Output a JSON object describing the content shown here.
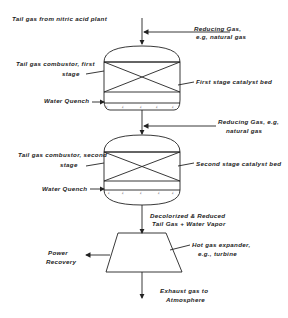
{
  "diagram": {
    "type": "process-flow",
    "labels": {
      "tail_gas_inlet": "Tail gas from nitric acid plant",
      "reducing_gas_1_line1": "Reducing Gas,",
      "reducing_gas_1_line2": "e.g, natural gas",
      "combustor_1_line1": "Tail gas combustor, first",
      "combustor_1_line2": "stage",
      "catalyst_bed_1": "First stage catalyst bed",
      "water_quench_1": "Water Quench",
      "reducing_gas_2_line1": "Reducing Gas, e.g,",
      "reducing_gas_2_line2": "natural gas",
      "combustor_2_line1": "Tail gas combustor, second",
      "combustor_2_line2": "stage",
      "catalyst_bed_2": "Second stage catalyst bed",
      "water_quench_2": "Water Quench",
      "outlet_1_line1": "Decolorized & Reduced",
      "outlet_1_line2": "Tail Gas + Water Vapor",
      "expander_line1": "Hot gas expander,",
      "expander_line2": "e.g., turbine",
      "power_line1": "Power",
      "power_line2": "Recovery",
      "exhaust_line1": "Exhaust gas to",
      "exhaust_line2": "Atmosphere"
    },
    "nodes": [
      {
        "id": "combustor-1",
        "label": "Tail gas combustor, first stage"
      },
      {
        "id": "combustor-2",
        "label": "Tail gas combustor, second stage"
      },
      {
        "id": "expander",
        "label": "Hot gas expander, e.g., turbine"
      }
    ],
    "edges": [
      {
        "from": "Tail gas from nitric acid plant",
        "to": "combustor-1"
      },
      {
        "from": "Reducing Gas (1)",
        "to": "combustor-1"
      },
      {
        "from": "combustor-1",
        "to": "combustor-2"
      },
      {
        "from": "Reducing Gas (2)",
        "to": "combustor-2"
      },
      {
        "from": "combustor-2",
        "to": "expander",
        "label": "Decolorized & Reduced Tail Gas + Water Vapor"
      },
      {
        "from": "expander",
        "to": "Power Recovery"
      },
      {
        "from": "expander",
        "to": "Exhaust gas to Atmosphere"
      }
    ]
  }
}
